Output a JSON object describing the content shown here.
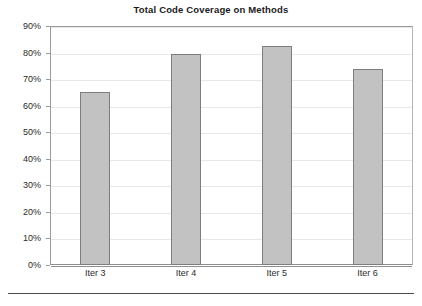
{
  "chart_data": {
    "type": "bar",
    "title": "Total Code Coverage on Methods",
    "xlabel": "",
    "ylabel": "",
    "categories": [
      "Iter 3",
      "Iter 4",
      "Iter 5",
      "Iter 6"
    ],
    "values": [
      65.3,
      79.4,
      82.6,
      73.7
    ],
    "value_labels": [
      "65%",
      "79%",
      "83%",
      "74%"
    ],
    "ylim": [
      0,
      90
    ],
    "ytick_values": [
      90,
      80,
      70,
      60,
      50,
      40,
      30,
      20,
      10,
      0
    ],
    "ytick_labels": [
      "90%",
      "80%",
      "70%",
      "60%",
      "50%",
      "40%",
      "30%",
      "20%",
      "10%",
      "0%"
    ],
    "grid": true,
    "legend": false,
    "legend_position": "none",
    "series": [
      {
        "name": "Total Code Coverage on Methods",
        "values": [
          65.3,
          79.4,
          82.6,
          73.7
        ]
      }
    ],
    "colors": {
      "bar_fill": "#c2c2c2",
      "bar_border": "#7d7d7d",
      "gridline": "#e8e8e8",
      "axis": "#9a9a9a",
      "text": "#1a1a1a",
      "background": "#ffffff",
      "bottom_rule": "#4a4a4a"
    }
  }
}
